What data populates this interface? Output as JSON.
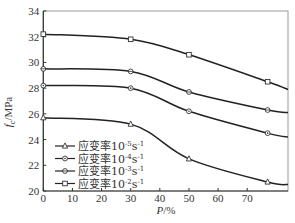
{
  "chart_data": {
    "type": "line",
    "title": "",
    "xlabel": "P/%",
    "ylabel": "f_c/MPa",
    "xlim": [
      0,
      84
    ],
    "ylim": [
      20,
      34
    ],
    "xticks": [
      0,
      10,
      20,
      30,
      40,
      50,
      60,
      70
    ],
    "yticks": [
      20,
      22,
      24,
      26,
      28,
      30,
      32,
      34
    ],
    "grid": false,
    "legend_position": "lower left",
    "x": [
      0,
      30,
      50,
      77
    ],
    "series": [
      {
        "name": "应变率10^-5 s^-1",
        "marker": "triangle",
        "values": [
          25.7,
          25.2,
          22.5,
          20.7
        ],
        "end_value": 20.5
      },
      {
        "name": "应变率10^-4 s^-1",
        "marker": "circle",
        "values": [
          28.2,
          28.0,
          26.2,
          24.5
        ],
        "end_value": 24.2
      },
      {
        "name": "应变率10^-3 s^-1",
        "marker": "diamond",
        "values": [
          29.5,
          29.3,
          27.7,
          26.3
        ],
        "end_value": 26.1
      },
      {
        "name": "应变率10^-2 s^-1",
        "marker": "square",
        "values": [
          32.2,
          31.8,
          30.6,
          28.5
        ],
        "end_value": 27.9
      }
    ]
  },
  "labels": {
    "xlabel_italic": "P",
    "xlabel_rest": "/%",
    "ylabel_italic": "f",
    "ylabel_sub": "c",
    "ylabel_rest": "/MPa"
  },
  "legend": [
    {
      "prefix": "应变率10",
      "exp": "-5",
      "unit": "s",
      "unit_exp": "-1",
      "marker": "triangle"
    },
    {
      "prefix": "应变率10",
      "exp": "-4",
      "unit": "s",
      "unit_exp": "-1",
      "marker": "circle"
    },
    {
      "prefix": "应变率10",
      "exp": "-3",
      "unit": "s",
      "unit_exp": "-1",
      "marker": "diamond"
    },
    {
      "prefix": "应变率10",
      "exp": "-2",
      "unit": "s",
      "unit_exp": "-1",
      "marker": "square"
    }
  ]
}
